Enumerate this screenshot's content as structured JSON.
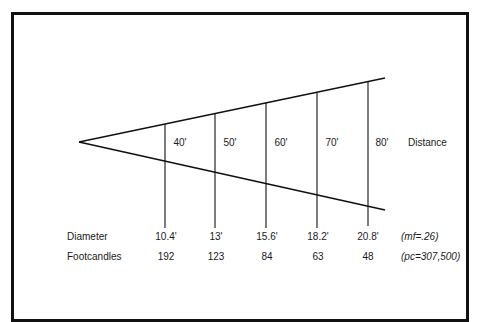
{
  "diagram": {
    "type": "beam-spread",
    "frame_color": "#111111",
    "line_color": "#111111",
    "axis_label": "Distance",
    "distances": [
      {
        "label": "40'",
        "diameter": "10.4'",
        "footcandles": "192"
      },
      {
        "label": "50'",
        "diameter": "13'",
        "footcandles": "123"
      },
      {
        "label": "60'",
        "diameter": "15.6'",
        "footcandles": "84"
      },
      {
        "label": "70'",
        "diameter": "18.2'",
        "footcandles": "63"
      },
      {
        "label": "80'",
        "diameter": "20.8'",
        "footcandles": "48"
      }
    ],
    "rows": {
      "diameter_label": "Diameter",
      "footcandles_label": "Footcandles"
    },
    "notes": {
      "multiplying_factor": "(mf=.26)",
      "peak_candela": "(pc=307,500)"
    }
  }
}
